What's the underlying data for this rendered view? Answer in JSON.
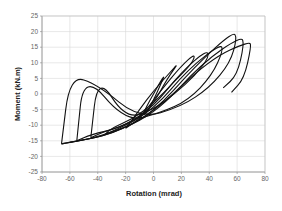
{
  "chart_data": {
    "type": "line",
    "title": "",
    "xlabel": "Rotation (mrad)",
    "ylabel": "Moment (kN.m)",
    "xlim": [
      -80,
      80
    ],
    "ylim": [
      -25,
      25
    ],
    "xticks": [
      -80,
      -60,
      -40,
      -20,
      0,
      20,
      40,
      60,
      80
    ],
    "yticks": [
      -25,
      -20,
      -15,
      -10,
      -5,
      0,
      5,
      10,
      15,
      20,
      25
    ],
    "grid": true,
    "legend": null,
    "series": [
      {
        "name": "cycle-1",
        "x": [
          -5,
          0,
          5,
          8,
          5,
          0,
          -5,
          -8,
          -5
        ],
        "y": [
          -6,
          -2,
          3,
          6,
          4,
          0,
          -4,
          -7,
          -6
        ]
      },
      {
        "name": "cycle-2",
        "x": [
          -20,
          -10,
          0,
          10,
          18,
          12,
          0,
          -10,
          -18,
          -20
        ],
        "y": [
          -11,
          -8,
          -3,
          5,
          10,
          7,
          1,
          -5,
          -10,
          -11
        ]
      },
      {
        "name": "cycle-3",
        "x": [
          -35,
          -25,
          -10,
          5,
          20,
          30,
          28,
          15,
          0,
          -15,
          -30,
          -35
        ],
        "y": [
          -13,
          -11,
          -8,
          1,
          9,
          13,
          10,
          4,
          -3,
          -8,
          -11,
          -13
        ]
      },
      {
        "name": "cycle-4",
        "x": [
          -45,
          -35,
          -20,
          0,
          20,
          38,
          40,
          30,
          15,
          0,
          -20,
          -40,
          -45
        ],
        "y": [
          -14,
          -12,
          -10,
          -4,
          7,
          14,
          12,
          6,
          0,
          -5,
          -8,
          6,
          -14
        ]
      },
      {
        "name": "cycle-5",
        "x": [
          -55,
          -45,
          -25,
          0,
          25,
          48,
          50,
          42,
          25,
          5,
          -20,
          -50,
          -55
        ],
        "y": [
          -15,
          -13,
          -11,
          -5,
          8,
          16,
          14,
          6,
          -2,
          -6,
          -9,
          7,
          -15
        ]
      },
      {
        "name": "cycle-6",
        "x": [
          -66,
          -55,
          -30,
          0,
          30,
          57,
          60,
          55,
          40,
          20,
          -10,
          -40,
          -60,
          -66
        ],
        "y": [
          -16,
          -15,
          -13,
          -6,
          9,
          20,
          18,
          10,
          2,
          -4,
          -8,
          3,
          6,
          -16
        ]
      },
      {
        "name": "cycle-7",
        "x": [
          -66,
          -40,
          0,
          35,
          63,
          65,
          60,
          50
        ],
        "y": [
          -16,
          -14,
          -7,
          10,
          18.5,
          16,
          6,
          2
        ]
      },
      {
        "name": "cycle-8",
        "x": [
          -60,
          -30,
          0,
          40,
          69,
          70,
          65,
          56
        ],
        "y": [
          -15.5,
          -13,
          -6,
          11,
          17,
          15,
          5,
          0.5
        ]
      }
    ]
  }
}
